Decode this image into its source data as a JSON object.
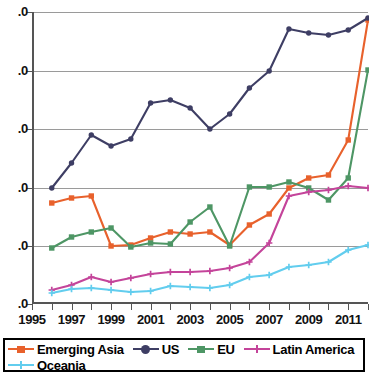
{
  "chart_data": {
    "type": "line",
    "title": "",
    "xlabel": "",
    "ylabel": "",
    "grid": true,
    "legend_position": "bottom",
    "x": [
      1996,
      1997,
      1998,
      1999,
      2000,
      2001,
      2002,
      2003,
      2004,
      2005,
      2006,
      2007,
      2008,
      2009,
      2010,
      2011,
      2012
    ],
    "xlim": [
      1995,
      2012
    ],
    "xticks": [
      1995,
      1996,
      1997,
      1998,
      1999,
      2000,
      2001,
      2002,
      2003,
      2004,
      2005,
      2006,
      2007,
      2008,
      2009,
      2010,
      2011,
      2012
    ],
    "xtick_labels_shown": [
      "1995",
      "1997",
      "1999",
      "2001",
      "2003",
      "2005",
      "2007",
      "2009",
      "2011"
    ],
    "ytick_labels": [
      ".0",
      ".0",
      ".0",
      ".0",
      ".0",
      ".0"
    ],
    "ytick_note": "y-axis numeric prefixes cropped off left edge of image; only decimal suffix visible",
    "ylim_pixels": [
      12,
      304
    ],
    "series": [
      {
        "name": "Emerging Asia",
        "color": "#E8612C",
        "marker": "square",
        "values_px": [
          203,
          198,
          196,
          246,
          245,
          238,
          232,
          234,
          232,
          245,
          225,
          214,
          188,
          178,
          175,
          140,
          20
        ]
      },
      {
        "name": "US",
        "color": "#3E3E64",
        "marker": "circle",
        "values_px": [
          188,
          163,
          135,
          146,
          139,
          103,
          100,
          108,
          129,
          114,
          88,
          71,
          29,
          33,
          35,
          30,
          18
        ]
      },
      {
        "name": "EU",
        "color": "#4E9665",
        "marker": "square",
        "values_px": [
          248,
          237,
          232,
          228,
          247,
          243,
          244,
          222,
          207,
          246,
          187,
          187,
          182,
          188,
          200,
          178,
          70
        ]
      },
      {
        "name": "Latin America",
        "color": "#C4449A",
        "marker": "plus",
        "values_px": [
          290,
          285,
          277,
          282,
          278,
          274,
          272,
          272,
          271,
          268,
          262,
          243,
          196,
          192,
          190,
          186,
          188
        ]
      },
      {
        "name": "Oceania",
        "color": "#62CDEE",
        "marker": "plus",
        "values_px": [
          293,
          289,
          288,
          290,
          292,
          291,
          286,
          287,
          288,
          285,
          277,
          275,
          267,
          265,
          262,
          250,
          245
        ]
      }
    ]
  },
  "legend": {
    "items": [
      {
        "label": "Emerging Asia",
        "color": "#E8612C",
        "marker": "square"
      },
      {
        "label": "US",
        "color": "#3E3E64",
        "marker": "circle"
      },
      {
        "label": "EU",
        "color": "#4E9665",
        "marker": "square"
      },
      {
        "label": "Latin America",
        "color": "#C4449A",
        "marker": "plus"
      },
      {
        "label": "Oceania",
        "color": "#62CDEE",
        "marker": "plus"
      }
    ]
  }
}
